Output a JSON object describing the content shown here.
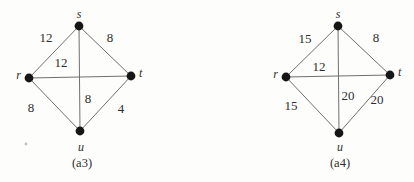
{
  "figure": {
    "colors": {
      "vertex": "#161616",
      "edge": "#707070",
      "ink": "#2e2e2e",
      "background": "#fdfdfc"
    },
    "graphs": [
      {
        "caption": "(a3)",
        "vertices": [
          {
            "label": "s"
          },
          {
            "label": "r"
          },
          {
            "label": "t"
          },
          {
            "label": "u"
          }
        ],
        "edges": [
          {
            "from": "s",
            "to": "r",
            "weight": "12"
          },
          {
            "from": "s",
            "to": "t",
            "weight": "8"
          },
          {
            "from": "r",
            "to": "t",
            "weight": "12"
          },
          {
            "from": "s",
            "to": "u",
            "weight": "8"
          },
          {
            "from": "r",
            "to": "u",
            "weight": "8"
          },
          {
            "from": "u",
            "to": "t",
            "weight": "4"
          }
        ]
      },
      {
        "caption": "(a4)",
        "vertices": [
          {
            "label": "s"
          },
          {
            "label": "r"
          },
          {
            "label": "t"
          },
          {
            "label": "u"
          }
        ],
        "edges": [
          {
            "from": "s",
            "to": "r",
            "weight": "15"
          },
          {
            "from": "s",
            "to": "t",
            "weight": "8"
          },
          {
            "from": "r",
            "to": "t",
            "weight": "12"
          },
          {
            "from": "s",
            "to": "u",
            "weight": "20"
          },
          {
            "from": "r",
            "to": "u",
            "weight": "15"
          },
          {
            "from": "u",
            "to": "t",
            "weight": "20"
          }
        ]
      }
    ]
  }
}
